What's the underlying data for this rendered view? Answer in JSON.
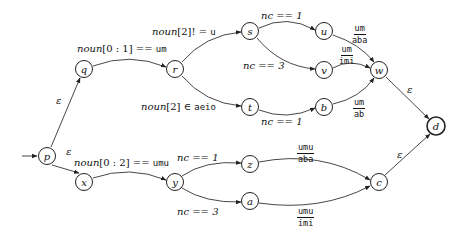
{
  "diagram": {
    "type": "finite-state-transducer",
    "start_state": "p",
    "accept_states": [
      "d"
    ],
    "nodes": [
      {
        "id": "p",
        "label": "p",
        "x": 47,
        "y": 156
      },
      {
        "id": "q",
        "label": "q",
        "x": 84,
        "y": 69
      },
      {
        "id": "r",
        "label": "r",
        "x": 175,
        "y": 69
      },
      {
        "id": "s",
        "label": "s",
        "x": 250,
        "y": 31
      },
      {
        "id": "t",
        "label": "t",
        "x": 250,
        "y": 107
      },
      {
        "id": "u",
        "label": "u",
        "x": 324,
        "y": 31
      },
      {
        "id": "v",
        "label": "v",
        "x": 324,
        "y": 70
      },
      {
        "id": "b",
        "label": "b",
        "x": 324,
        "y": 107
      },
      {
        "id": "w",
        "label": "w",
        "x": 379,
        "y": 70
      },
      {
        "id": "d",
        "label": "d",
        "x": 436,
        "y": 126
      },
      {
        "id": "x",
        "label": "x",
        "x": 84,
        "y": 182
      },
      {
        "id": "y",
        "label": "y",
        "x": 175,
        "y": 182
      },
      {
        "id": "z",
        "label": "z",
        "x": 250,
        "y": 164
      },
      {
        "id": "a",
        "label": "a",
        "x": 250,
        "y": 201
      },
      {
        "id": "c",
        "label": "c",
        "x": 379,
        "y": 182
      }
    ],
    "edges": [
      {
        "from": "p",
        "to": "q",
        "label": "ε"
      },
      {
        "from": "p",
        "to": "x",
        "label": "ε"
      },
      {
        "from": "q",
        "to": "r",
        "label_var": "noun",
        "label_rest": "[0 : 1] == ",
        "label_mono": "um"
      },
      {
        "from": "r",
        "to": "s",
        "label_var": "noun",
        "label_rest": "[2]! = ",
        "label_mono": "u"
      },
      {
        "from": "r",
        "to": "t",
        "label_var": "noun",
        "label_rest": "[2] ∈ ",
        "label_mono": "aeio"
      },
      {
        "from": "s",
        "to": "u",
        "label": "nc == 1"
      },
      {
        "from": "s",
        "to": "v",
        "label": "nc == 3"
      },
      {
        "from": "t",
        "to": "b",
        "label": "nc == 1"
      },
      {
        "from": "u",
        "to": "w",
        "label_num": "um",
        "label_den": "aba"
      },
      {
        "from": "v",
        "to": "w",
        "label_num": "um",
        "label_den": "imi"
      },
      {
        "from": "b",
        "to": "w",
        "label_num": "um",
        "label_den": "ab"
      },
      {
        "from": "w",
        "to": "d",
        "label": "ε"
      },
      {
        "from": "x",
        "to": "y",
        "label_var": "noun",
        "label_rest": "[0 : 2] == ",
        "label_mono": "umu"
      },
      {
        "from": "y",
        "to": "z",
        "label": "nc == 1"
      },
      {
        "from": "y",
        "to": "a",
        "label": "nc == 3"
      },
      {
        "from": "z",
        "to": "c",
        "label_num": "umu",
        "label_den": "aba"
      },
      {
        "from": "a",
        "to": "c",
        "label_num": "umu",
        "label_den": "imi"
      },
      {
        "from": "c",
        "to": "d",
        "label": "ε"
      }
    ]
  },
  "labels": {
    "eps_pq": "ε",
    "eps_px": "ε",
    "eps_wd": "ε",
    "eps_cd": "ε",
    "qr_var": "noun",
    "qr_rest": "[0 : 1] == ",
    "qr_mono": "um",
    "rs_var": "noun",
    "rs_rest": "[2]! = ",
    "rs_mono": "u",
    "rt_var": "noun",
    "rt_rest": "[2] ∈ ",
    "rt_mono": "aeio",
    "su": "nc == 1",
    "sv": "nc == 3",
    "tb": "nc == 1",
    "uw_num": "um",
    "uw_den": "aba",
    "vw_num": "um",
    "vw_den": "imi",
    "bw_num": "um",
    "bw_den": "ab",
    "xy_var": "noun",
    "xy_rest": "[0 : 2] == ",
    "xy_mono": "umu",
    "yz": "nc == 1",
    "ya": "nc == 3",
    "zc_num": "umu",
    "zc_den": "aba",
    "ac_num": "umu",
    "ac_den": "imi"
  },
  "node_labels": {
    "p": "p",
    "q": "q",
    "r": "r",
    "s": "s",
    "t": "t",
    "u": "u",
    "v": "v",
    "b": "b",
    "w": "w",
    "d": "d",
    "x": "x",
    "y": "y",
    "z": "z",
    "a": "a",
    "c": "c"
  }
}
